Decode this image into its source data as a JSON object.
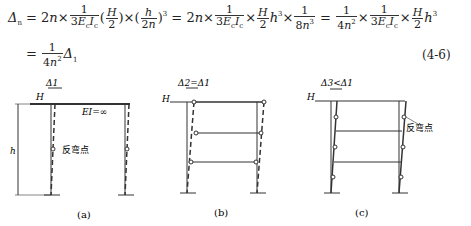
{
  "equation": {
    "line1_lhs": "Δn = 2n×",
    "frac1": {
      "num": "1",
      "den": "3EcIc"
    },
    "term_H2": "(H/2)",
    "term_h2n": "(h/2n)³",
    "eq2": "= 2n×",
    "frac2": {
      "num": "1",
      "den": "3EcIc"
    },
    "frac3": {
      "num": "H",
      "den": "2"
    },
    "h3": "h³",
    "frac4": {
      "num": "1",
      "den": "8n³"
    },
    "frac5": {
      "num": "1",
      "den": "4n²"
    },
    "frac6": {
      "num": "1",
      "den": "3EcIc"
    },
    "frac7": {
      "num": "H",
      "den": "2"
    },
    "line2": "= 1/(4n²) Δ1",
    "number": "(4-6)"
  },
  "figures": [
    {
      "id": "a",
      "caption": "(a)",
      "labels": {
        "load": "H",
        "height": "h",
        "displacement": "Δ1",
        "rigidity": "EI=∞",
        "inflection": "反弯点"
      }
    },
    {
      "id": "b",
      "caption": "(b)",
      "labels": {
        "load": "H",
        "displacement": "Δ2=Δ1"
      }
    },
    {
      "id": "c",
      "caption": "(c)",
      "labels": {
        "load": "H",
        "displacement": "Δ3<Δ1",
        "inflection": "反弯点"
      }
    }
  ]
}
